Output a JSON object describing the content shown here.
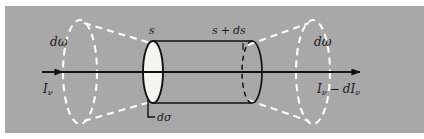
{
  "figure": {
    "background_color": "#a8a8a8",
    "page_color": "#ffffff",
    "line_color": "#111111",
    "dashed_color": "#ffffff",
    "cap_fill_color": "#f2f2f2"
  },
  "labels": {
    "solid_angle_left": "dω",
    "solid_angle_right": "dω",
    "intensity_in_symbol": "I",
    "intensity_in_sub": "ν",
    "intensity_out_symbol": "I",
    "intensity_out_sub": "ν",
    "intensity_out_minus": "−",
    "intensity_out_d": "dI",
    "intensity_out_d_sub": "ν",
    "path_start": "s",
    "path_end_s": "s",
    "path_end_plus": "+",
    "path_end_ds": "ds",
    "area_element": "dσ"
  },
  "geometry": {
    "axis_y": 72,
    "axis_start_x": 42,
    "axis_end_x": 360,
    "cylinder_left_x": 153,
    "cylinder_right_x": 252,
    "cylinder_cap_rx": 10,
    "cylinder_cap_ry": 31,
    "cone_left_ellipse_cx": 80,
    "cone_right_ellipse_cx": 313,
    "cone_ellipse_rx": 17,
    "cone_ellipse_ry": 52
  }
}
